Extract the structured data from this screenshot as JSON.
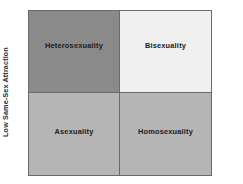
{
  "figure": {
    "background_color": "#ffffff",
    "border_color": "#6a6a6a"
  },
  "axes": {
    "left_label": "Low Same-Sex Attraction",
    "right_label": "High Same-Sex Attraction"
  },
  "chart_data": {
    "type": "table",
    "title": "",
    "subtitle": "",
    "xlabel": "",
    "ylabel": "",
    "grid": false,
    "legend_position": "none",
    "layout": "2x2-quadrant-matrix",
    "row_axis": "Same-Sex Attraction (low at left caption, high at right caption)",
    "quadrants": [
      {
        "position": "top-left",
        "label": "Heterosexuality",
        "fill_color": "#8a8a8a",
        "text_color": "#1c1c1c"
      },
      {
        "position": "top-right",
        "label": "Bisexuality",
        "fill_color": "#f0f0f0",
        "text_color": "#1c1c1c"
      },
      {
        "position": "bottom-left",
        "label": "Asexuality",
        "fill_color": "#b5b5b5",
        "text_color": "#1c1c1c"
      },
      {
        "position": "bottom-right",
        "label": "Homosexuality",
        "fill_color": "#b5b5b5",
        "text_color": "#1c1c1c"
      }
    ]
  }
}
